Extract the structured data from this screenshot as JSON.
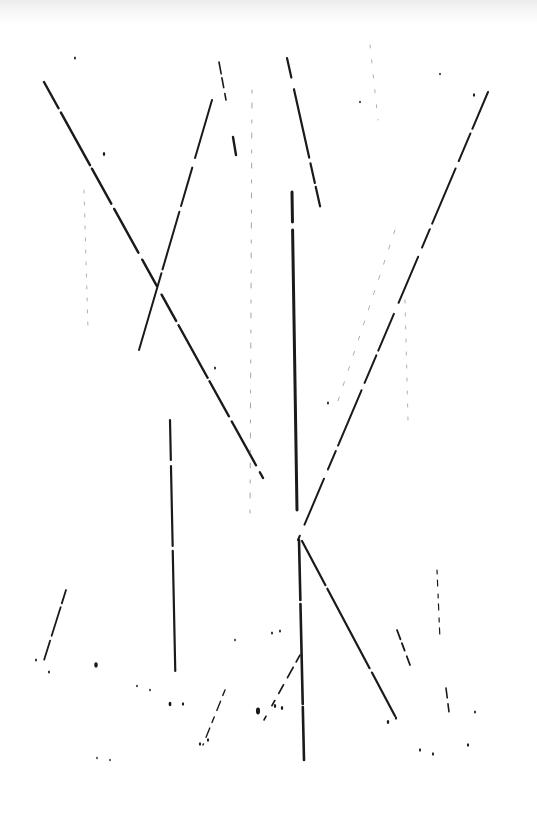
{
  "artwork": {
    "description": "Abstract ink drawing of straight dark strokes on white paper",
    "background_color": "#ffffff",
    "ink_color": "#1a1a1a",
    "faint_ink_color": "#9a9a9a",
    "strokes": [
      {
        "id": "diag-left-long",
        "x1": 44,
        "y1": 82,
        "x2": 263,
        "y2": 478,
        "width": 2.4,
        "dash": "30 5 60 4 40 6 50 8 30 10"
      },
      {
        "id": "diag-left-up",
        "x1": 139,
        "y1": 350,
        "x2": 212,
        "y2": 100,
        "width": 2.0,
        "dash": "80 4 60 6 40 10"
      },
      {
        "id": "diag-top-short-a",
        "x1": 219,
        "y1": 62,
        "x2": 226,
        "y2": 100,
        "width": 1.6,
        "dash": "12 4 10 6"
      },
      {
        "id": "diag-top-short-b",
        "x1": 233,
        "y1": 137,
        "x2": 236,
        "y2": 155,
        "width": 2.4,
        "dash": ""
      },
      {
        "id": "diag-center-top",
        "x1": 287,
        "y1": 58,
        "x2": 322,
        "y2": 215,
        "width": 2.2,
        "dash": "20 12 70 6 20 4"
      },
      {
        "id": "vertical-center-upper",
        "x1": 292,
        "y1": 192,
        "x2": 297,
        "y2": 510,
        "width": 3.0,
        "dash": "30 8 290"
      },
      {
        "id": "vertical-center-lower",
        "x1": 299,
        "y1": 540,
        "x2": 304,
        "y2": 760,
        "width": 2.6,
        "dash": "60 4 100 3 60"
      },
      {
        "id": "vertical-left",
        "x1": 170,
        "y1": 420,
        "x2": 176,
        "y2": 706,
        "width": 2.2,
        "dash": "40 6 80 5 120"
      },
      {
        "id": "diag-right-long",
        "x1": 488,
        "y1": 92,
        "x2": 298,
        "y2": 540,
        "width": 2.0,
        "dash": "40 5 30 8 60 6 20 10 50 12"
      },
      {
        "id": "diag-right-lower",
        "x1": 302,
        "y1": 541,
        "x2": 395,
        "y2": 716,
        "width": 2.2,
        "dash": "50 4 90 5 60"
      },
      {
        "id": "diag-bottom-left",
        "x1": 66,
        "y1": 590,
        "x2": 40,
        "y2": 673,
        "width": 1.8,
        "dash": "14 4 30 5 20"
      },
      {
        "id": "diag-bottom-center",
        "x1": 300,
        "y1": 655,
        "x2": 264,
        "y2": 720,
        "width": 1.6,
        "dash": "8 6 12 8 10"
      },
      {
        "id": "diag-bottom-center-b",
        "x1": 225,
        "y1": 690,
        "x2": 203,
        "y2": 745,
        "width": 1.4,
        "dash": "6 6 10 7"
      },
      {
        "id": "vertical-right-faint",
        "x1": 437,
        "y1": 570,
        "x2": 440,
        "y2": 640,
        "width": 1.2,
        "dash": "4 6 6 8"
      },
      {
        "id": "diag-right-bottom-short",
        "x1": 397,
        "y1": 630,
        "x2": 410,
        "y2": 665,
        "width": 1.8,
        "dash": "10 4 8 6"
      },
      {
        "id": "diag-right-bottom-b",
        "x1": 446,
        "y1": 688,
        "x2": 450,
        "y2": 720,
        "width": 1.6,
        "dash": "10 6 8"
      },
      {
        "id": "faint-vertical-1",
        "x1": 84,
        "y1": 190,
        "x2": 88,
        "y2": 330,
        "width": 0.8,
        "dash": "3 9"
      },
      {
        "id": "faint-vertical-2",
        "x1": 252,
        "y1": 90,
        "x2": 250,
        "y2": 520,
        "width": 0.9,
        "dash": "3 10 5 12"
      },
      {
        "id": "faint-vertical-3",
        "x1": 405,
        "y1": 300,
        "x2": 408,
        "y2": 420,
        "width": 0.8,
        "dash": "3 10"
      },
      {
        "id": "faint-diag-1",
        "x1": 370,
        "y1": 45,
        "x2": 378,
        "y2": 120,
        "width": 0.8,
        "dash": "3 12"
      },
      {
        "id": "faint-diag-2",
        "x1": 395,
        "y1": 230,
        "x2": 335,
        "y2": 410,
        "width": 0.8,
        "dash": "4 12"
      }
    ],
    "specks": [
      {
        "cx": 75,
        "cy": 58,
        "r": 1.2
      },
      {
        "cx": 104,
        "cy": 154,
        "r": 1.5
      },
      {
        "cx": 96,
        "cy": 665,
        "r": 2.2
      },
      {
        "cx": 258,
        "cy": 711,
        "r": 2.6
      },
      {
        "cx": 275,
        "cy": 706,
        "r": 1.5
      },
      {
        "cx": 282,
        "cy": 708,
        "r": 1.5
      },
      {
        "cx": 200,
        "cy": 744,
        "r": 1.4
      },
      {
        "cx": 208,
        "cy": 740,
        "r": 1.4
      },
      {
        "cx": 388,
        "cy": 722,
        "r": 1.6
      },
      {
        "cx": 396,
        "cy": 718,
        "r": 1.4
      },
      {
        "cx": 420,
        "cy": 750,
        "r": 1.3
      },
      {
        "cx": 433,
        "cy": 754,
        "r": 1.3
      },
      {
        "cx": 468,
        "cy": 745,
        "r": 1.4
      },
      {
        "cx": 475,
        "cy": 712,
        "r": 1.2
      },
      {
        "cx": 360,
        "cy": 102,
        "r": 1.0
      },
      {
        "cx": 440,
        "cy": 74,
        "r": 1.0
      },
      {
        "cx": 474,
        "cy": 95,
        "r": 1.4
      },
      {
        "cx": 36,
        "cy": 660,
        "r": 1.2
      },
      {
        "cx": 49,
        "cy": 672,
        "r": 1.2
      },
      {
        "cx": 170,
        "cy": 704,
        "r": 1.8
      },
      {
        "cx": 183,
        "cy": 704,
        "r": 1.4
      },
      {
        "cx": 137,
        "cy": 686,
        "r": 1.0
      },
      {
        "cx": 150,
        "cy": 690,
        "r": 1.0
      },
      {
        "cx": 272,
        "cy": 633,
        "r": 1.2
      },
      {
        "cx": 280,
        "cy": 631,
        "r": 1.2
      },
      {
        "cx": 110,
        "cy": 760,
        "r": 0.9
      },
      {
        "cx": 97,
        "cy": 758,
        "r": 0.9
      },
      {
        "cx": 215,
        "cy": 368,
        "r": 1.2
      },
      {
        "cx": 328,
        "cy": 403,
        "r": 1.2
      },
      {
        "cx": 235,
        "cy": 640,
        "r": 1.0
      }
    ]
  }
}
